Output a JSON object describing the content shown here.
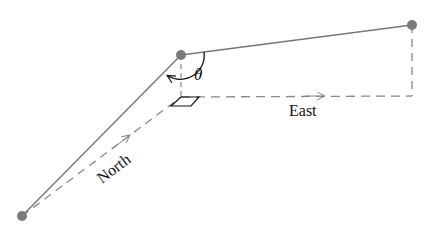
{
  "diagram": {
    "labels": {
      "angle": "θ",
      "east": "East",
      "north": "North"
    },
    "points": {
      "origin": [
        22,
        216
      ],
      "middle": [
        181,
        55
      ],
      "end": [
        412,
        25
      ],
      "right_angle_corner": [
        181,
        97
      ],
      "east_end": [
        412,
        96
      ]
    },
    "colors": {
      "line": "#777777",
      "dashed": "#888888",
      "point": "#7a7a7a",
      "text": "#111111"
    }
  }
}
